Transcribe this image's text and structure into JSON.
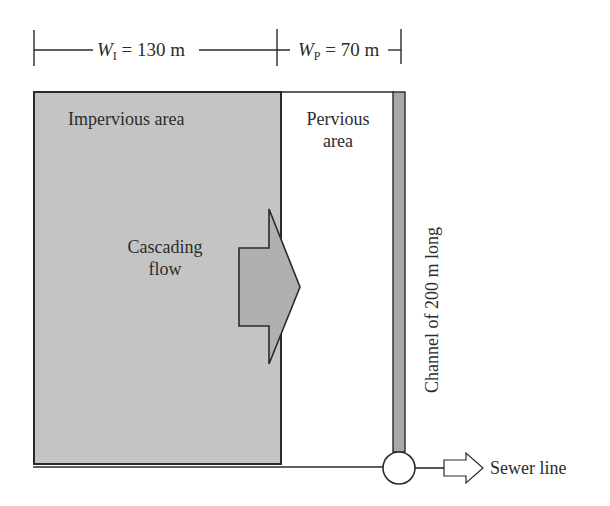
{
  "diagram": {
    "dimensions": {
      "impervious_width": {
        "symbol": "W",
        "subscript": "I",
        "value_text": "= 130 m"
      },
      "pervious_width": {
        "symbol": "W",
        "subscript": "P",
        "value_text": "= 70 m"
      }
    },
    "regions": {
      "impervious": {
        "label": "Impervious area",
        "fill": "#c4c4c4"
      },
      "pervious": {
        "label_line1": "Pervious",
        "label_line2": "area",
        "fill": "#ffffff"
      },
      "channel": {
        "label": "Channel of 200 m long",
        "fill": "#a9a9a9"
      }
    },
    "flow_arrow": {
      "label_line1": "Cascading",
      "label_line2": "flow",
      "fill": "#b0b0b0"
    },
    "outlet": {
      "label": "Sewer line"
    },
    "colors": {
      "stroke": "#2a2a2a",
      "impervious": "#c4c4c4",
      "arrow": "#b0b0b0",
      "channel": "#a9a9a9"
    }
  }
}
